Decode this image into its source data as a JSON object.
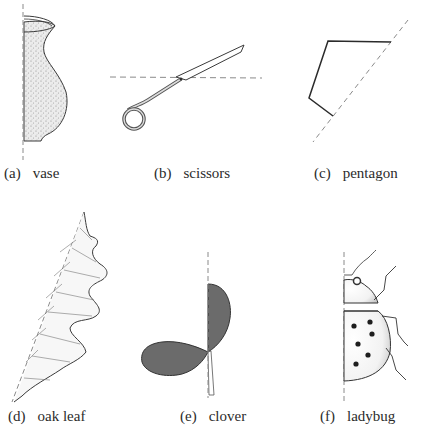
{
  "figures": [
    {
      "id": "a",
      "letter": "(a)",
      "name": "vase"
    },
    {
      "id": "b",
      "letter": "(b)",
      "name": "scissors"
    },
    {
      "id": "c",
      "letter": "(c)",
      "name": "pentagon"
    },
    {
      "id": "d",
      "letter": "(d)",
      "name": "oak leaf"
    },
    {
      "id": "e",
      "letter": "(e)",
      "name": "clover"
    },
    {
      "id": "f",
      "letter": "(f)",
      "name": "ladybug"
    }
  ],
  "colors": {
    "ink": "#2b2b2b",
    "dashed_axis": "#8a8a8a",
    "clover_fill": "#6b6b6b",
    "stipple": "#9a9a9a"
  }
}
